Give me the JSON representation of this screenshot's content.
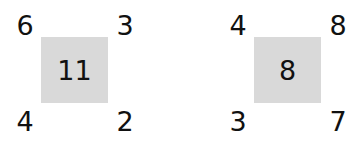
{
  "page": {
    "background_color": "#ffffff",
    "text_color": "#111111",
    "box_fill_color": "#d9d9d9",
    "title": ""
  },
  "diagram": {
    "type": "corner-sum-cells",
    "groups": [
      {
        "name": "cell-group-1",
        "center": "11",
        "corners": {
          "top_left": "6",
          "top_right": "3",
          "bottom_left": "4",
          "bottom_right": "2"
        }
      },
      {
        "name": "cell-group-2",
        "center": "8",
        "corners": {
          "top_left": "4",
          "top_right": "8",
          "bottom_left": "3",
          "bottom_right": "7"
        }
      }
    ]
  }
}
